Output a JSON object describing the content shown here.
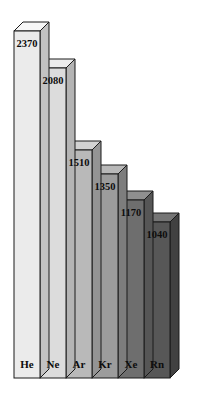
{
  "chart_data": {
    "type": "bar",
    "title": "",
    "subtitle": "",
    "xlabel": "",
    "ylabel": "",
    "categories": [
      "He",
      "Ne",
      "Ar",
      "Kr",
      "Xe",
      "Rn"
    ],
    "values": [
      2370,
      2080,
      1510,
      1350,
      1170,
      1040
    ],
    "value_labels": [
      "2370",
      "2080",
      "1510",
      "1350",
      "1170",
      "1040"
    ],
    "ylim": [
      0,
      2370
    ],
    "grid": false,
    "legend": null,
    "style": "3d-isometric-bars",
    "bar_colors": [
      "#ebebeb",
      "#dcdcdc",
      "#b9b9b9",
      "#9c9c9c",
      "#6e6e6e",
      "#575757"
    ],
    "bar_top_colors": [
      "#f7f7f7",
      "#ececec",
      "#d2d2d2",
      "#b8b8b8",
      "#8f8f8f",
      "#757575"
    ],
    "bar_side_colors": [
      "#c2c2c2",
      "#b4b4b4",
      "#949494",
      "#7d7d7d",
      "#565656",
      "#414141"
    ],
    "outline_color": "#1a1a1a",
    "background": "#ffffff",
    "label_text_colors": [
      "#0d0d0d",
      "#0d0d0d",
      "#0d0d0d",
      "#0d0d0d",
      "#f2f2f2",
      "#f2f2f2"
    ],
    "category_text_colors": [
      "#0d0d0d",
      "#0d0d0d",
      "#0d0d0d",
      "#0d0d0d",
      "#f2f2f2",
      "#f2f2f2"
    ]
  },
  "geometry": {
    "baseline_y": 378,
    "left_x": 14,
    "bar_width": 26,
    "depth_x": 9,
    "depth_y": 9,
    "top_ys": [
      31,
      68,
      150,
      174,
      200,
      222
    ],
    "category_label_y": 365,
    "value_label_dy": 14
  }
}
